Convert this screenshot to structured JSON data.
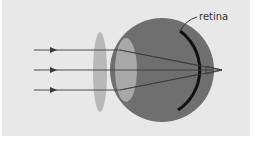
{
  "figure": {
    "labels": {
      "retina": "retina"
    },
    "colors": {
      "background": "#e8e8e8",
      "eyeball": "#6f6f6f",
      "lens": "#b4b4b4",
      "cornea": "#a2a2a2",
      "retina": "#111111",
      "rays": "#3a3a3a"
    },
    "elements": [
      {
        "name": "incoming-rays",
        "count": 3
      },
      {
        "name": "corrective-lens",
        "shape": "biconvex"
      },
      {
        "name": "eyeball"
      },
      {
        "name": "eye-lens"
      },
      {
        "name": "retina"
      },
      {
        "name": "focal-point",
        "position": "behind retina"
      }
    ]
  }
}
